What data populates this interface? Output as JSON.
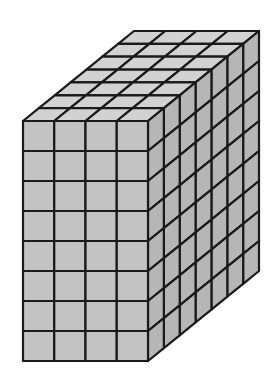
{
  "figure": {
    "title": "Rectangular prism built from unit cubes",
    "dimensions": {
      "width_cubes": 4,
      "height_cubes": 8,
      "depth_cubes": 7
    },
    "colors": {
      "top_face": "#d2d2d2",
      "front_face": "#c3c3c3",
      "side_face": "#b6b6b6",
      "edge": "#1a1a1a",
      "background": "#ffffff"
    },
    "geometry": {
      "front_x": 23,
      "front_y": 121,
      "front_width": 125,
      "front_height": 240,
      "depth_dx": 111,
      "depth_dy": -90
    }
  }
}
